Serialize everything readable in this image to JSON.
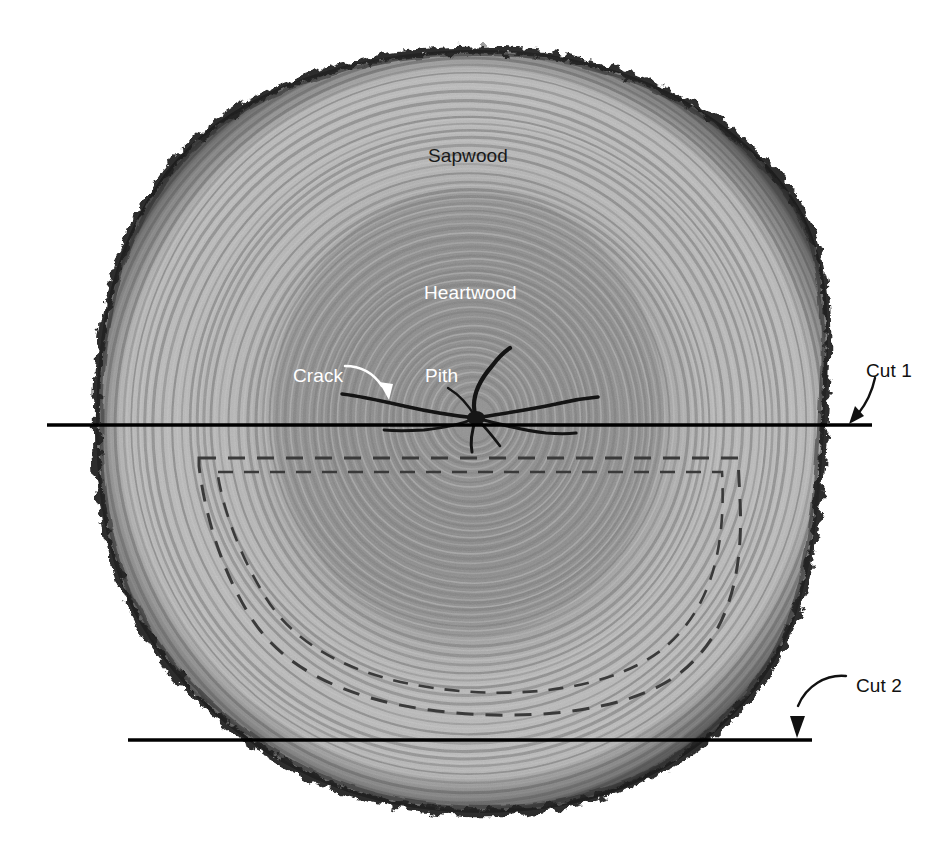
{
  "figure": {
    "kind": "tree-trunk-cross-section-diagram",
    "background_color": "#ffffff",
    "canvas": {
      "width": 948,
      "height": 860
    }
  },
  "labels": {
    "sapwood": {
      "text": "Sapwood",
      "color": "#1a1a1a",
      "x": 428,
      "y": 146
    },
    "heartwood": {
      "text": "Heartwood",
      "color": "#ffffff",
      "x": 424,
      "y": 283
    },
    "crack": {
      "text": "Crack",
      "color": "#ffffff",
      "x": 293,
      "y": 366
    },
    "pith": {
      "text": "Pith",
      "color": "#ffffff",
      "x": 425,
      "y": 366
    },
    "cut1": {
      "text": "Cut 1",
      "color": "#111111",
      "x": 866,
      "y": 361
    },
    "cut2": {
      "text": "Cut 2",
      "color": "#111111",
      "x": 856,
      "y": 676
    }
  },
  "annotations": {
    "cut_lines": [
      {
        "name": "Cut 1",
        "y": 425,
        "x_start": 47,
        "x_end": 872,
        "color": "#000000",
        "width": 3.4
      },
      {
        "name": "Cut 2",
        "y": 740,
        "x_start": 128,
        "x_end": 812,
        "color": "#000000",
        "width": 3.4
      }
    ],
    "leader_arrows": [
      {
        "name": "crack-arrow",
        "color": "#ffffff",
        "from_label": "Crack",
        "points_to": "crack"
      },
      {
        "name": "cut1-arrow",
        "color": "#111111",
        "from_label": "Cut 1",
        "points_to": "Cut 1 line"
      },
      {
        "name": "cut2-arrow",
        "color": "#111111",
        "from_label": "Cut 2",
        "points_to": "Cut 2 line"
      }
    ],
    "dashed_outline": {
      "name": "recovered-board-outline",
      "style": "dashed",
      "color": "#3b3b3b",
      "curves": 2,
      "top_y": 456,
      "bottom_y": 700,
      "left_x": 196,
      "right_x": 740
    }
  },
  "trunk": {
    "bark_color": "#1f1f1f",
    "sapwood_color": "#b5b5b5",
    "heartwood_color": "#8e8e8e",
    "center": {
      "x": 472,
      "y": 418
    },
    "extent": {
      "left": 96,
      "right": 827,
      "top": 50,
      "bottom": 812
    },
    "ring_count": 46
  },
  "chart_data": {
    "type": "diagram",
    "annotated_features": [
      "Sapwood",
      "Heartwood",
      "Pith",
      "Crack",
      "Cut 1",
      "Cut 2"
    ]
  }
}
